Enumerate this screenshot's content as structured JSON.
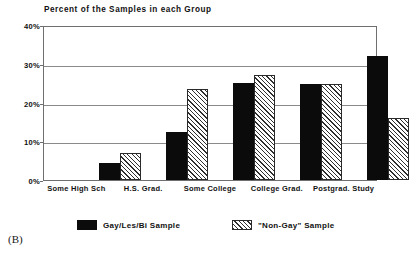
{
  "panel": {
    "letter": "(B)"
  },
  "chart_data": {
    "type": "bar",
    "title": "Percent of the Samples in each Group",
    "xlabel": "",
    "ylabel": "",
    "ylim": [
      0,
      40
    ],
    "yticks": [
      "0%",
      "10%",
      "20%",
      "30%",
      "40%"
    ],
    "ytick_values": [
      0,
      10,
      20,
      30,
      40
    ],
    "grid": true,
    "legend_position": "bottom",
    "categories": [
      "Some High Sch",
      "H.S. Grad.",
      "Some College",
      "College Grad.",
      "Postgrad. Study"
    ],
    "series": [
      {
        "name": "Gay/Les/Bi Sample",
        "fill": "solid-black",
        "color": "#0b0b0b",
        "values": [
          4.5,
          12.5,
          25.0,
          24.8,
          32.0
        ]
      },
      {
        "name": "\"Non-Gay\" Sample",
        "fill": "diagonal-hatch",
        "color": "#ffffff",
        "values": [
          7.0,
          23.5,
          27.0,
          24.8,
          16.0
        ]
      }
    ]
  },
  "legend": {
    "entries": [
      {
        "label": "Gay/Les/Bi Sample",
        "swatch": "solid"
      },
      {
        "label": "\"Non-Gay\" Sample",
        "swatch": "hatched"
      }
    ]
  }
}
